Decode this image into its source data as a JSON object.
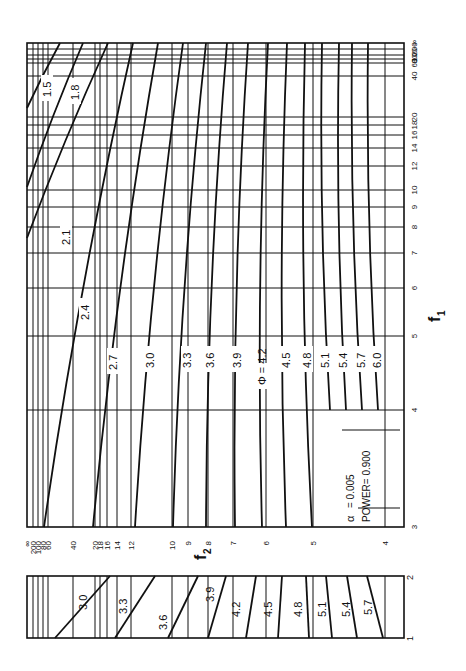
{
  "chart_data": {
    "type": "line",
    "orientation": "rotated 90 degrees clockwise",
    "annotation": {
      "alpha_label": "α",
      "alpha_value": "= 0.005",
      "power_label": "POWER= 0.900"
    },
    "main_plot": {
      "xlabel": "f2",
      "ylabel": "f1",
      "f2_ticks": [
        {
          "label": "∞",
          "x": 27
        },
        {
          "label": "200",
          "x": 33
        },
        {
          "label": "100",
          "x": 38
        },
        {
          "label": "80",
          "x": 43
        },
        {
          "label": "60",
          "x": 48
        },
        {
          "label": "40",
          "x": 73
        },
        {
          "label": "20",
          "x": 95
        },
        {
          "label": "18",
          "x": 100
        },
        {
          "label": "16",
          "x": 107
        },
        {
          "label": "14",
          "x": 117
        },
        {
          "label": "12",
          "x": 131
        },
        {
          "label": "10",
          "x": 172
        },
        {
          "label": "9",
          "x": 188
        },
        {
          "label": "8",
          "x": 208
        },
        {
          "label": "7",
          "x": 233
        },
        {
          "label": "6",
          "x": 266
        },
        {
          "label": "5",
          "x": 313
        },
        {
          "label": "4",
          "x": 385
        }
      ],
      "f1_ticks": [
        {
          "label": "∞",
          "y": 43
        },
        {
          "label": "200",
          "y": 49
        },
        {
          "label": "100",
          "y": 55
        },
        {
          "label": "80",
          "y": 59
        },
        {
          "label": "60",
          "y": 63
        },
        {
          "label": "40",
          "y": 76
        },
        {
          "label": "20",
          "y": 117
        },
        {
          "label": "18",
          "y": 125
        },
        {
          "label": "16",
          "y": 135
        },
        {
          "label": "14",
          "y": 148
        },
        {
          "label": "12",
          "y": 166
        },
        {
          "label": "10",
          "y": 190
        },
        {
          "label": "9",
          "y": 207
        },
        {
          "label": "8",
          "y": 227
        },
        {
          "label": "7",
          "y": 253
        },
        {
          "label": "6",
          "y": 288
        },
        {
          "label": "5",
          "y": 336
        },
        {
          "label": "4",
          "y": 410
        },
        {
          "label": "3",
          "y": 527
        }
      ],
      "series": [
        {
          "name": "1.5",
          "x0": 27,
          "y0": 108,
          "x1": 60,
          "y1": 43
        },
        {
          "name": "1.8",
          "x0": 27,
          "y0": 187,
          "x1": 83,
          "y1": 43
        },
        {
          "name": "2.1",
          "x0": 27,
          "y0": 238,
          "x1": 108,
          "y1": 43
        },
        {
          "name": "2.4",
          "x0": 44,
          "y0": 527,
          "x1": 133,
          "y1": 43
        },
        {
          "name": "2.7",
          "x0": 93,
          "y0": 527,
          "x1": 158,
          "y1": 43
        },
        {
          "name": "3.0",
          "x0": 135,
          "y0": 527,
          "x1": 183,
          "y1": 43
        },
        {
          "name": "3.3",
          "x0": 173,
          "y0": 527,
          "x1": 206,
          "y1": 43
        },
        {
          "name": "3.6",
          "x0": 206,
          "y0": 527,
          "x1": 227,
          "y1": 43
        },
        {
          "name": "3.9",
          "x0": 235,
          "y0": 527,
          "x1": 248,
          "y1": 43
        },
        {
          "name": "Φ=4.2",
          "x0": 262,
          "y0": 527,
          "x1": 268,
          "y1": 43
        },
        {
          "name": "4.5",
          "x0": 286,
          "y0": 527,
          "x1": 287,
          "y1": 43
        },
        {
          "name": "4.8",
          "x0": 312,
          "y0": 527,
          "x1": 305,
          "y1": 43
        },
        {
          "name": "5.1",
          "x0": 330,
          "y0": 410,
          "x1": 322,
          "y1": 43
        },
        {
          "name": "5.4",
          "x0": 346,
          "y0": 410,
          "x1": 339,
          "y1": 43
        },
        {
          "name": "5.7",
          "x0": 362,
          "y0": 410,
          "x1": 352,
          "y1": 43
        },
        {
          "name": "6.0",
          "x0": 378,
          "y0": 410,
          "x1": 368,
          "y1": 43
        }
      ],
      "curve_labels": [
        {
          "text": "1.5",
          "x": 47,
          "y": 97
        },
        {
          "text": "1.8",
          "x": 75,
          "y": 100
        },
        {
          "text": "2.1",
          "x": 66,
          "y": 245
        },
        {
          "text": "2.4",
          "x": 85,
          "y": 320
        },
        {
          "text": "2.7",
          "x": 113,
          "y": 370
        },
        {
          "text": "3.0",
          "x": 150,
          "y": 368
        },
        {
          "text": "3.3",
          "x": 187,
          "y": 368
        },
        {
          "text": "3.6",
          "x": 210,
          "y": 368
        },
        {
          "text": "3.9",
          "x": 237,
          "y": 368
        },
        {
          "text": "Φ = 4.2",
          "x": 262,
          "y": 385
        },
        {
          "text": "4.5",
          "x": 286,
          "y": 368
        },
        {
          "text": "4.8",
          "x": 307,
          "y": 368
        },
        {
          "text": "5.1",
          "x": 325,
          "y": 368
        },
        {
          "text": "5.4",
          "x": 343,
          "y": 368
        },
        {
          "text": "5.7",
          "x": 361,
          "y": 368
        },
        {
          "text": "6.0",
          "x": 377,
          "y": 368
        }
      ]
    },
    "inset_plot": {
      "ylabel": "f1",
      "f1_range": [
        "1",
        "2"
      ],
      "series": [
        {
          "name": "3.0",
          "x0": 55,
          "y0": 638,
          "x1": 110,
          "y1": 576
        },
        {
          "name": "3.3",
          "x0": 115,
          "y0": 638,
          "x1": 155,
          "y1": 576
        },
        {
          "name": "3.6",
          "x0": 168,
          "y0": 638,
          "x1": 198,
          "y1": 576
        },
        {
          "name": "3.9",
          "x0": 208,
          "y0": 638,
          "x1": 226,
          "y1": 576
        },
        {
          "name": "4.2",
          "x0": 246,
          "y0": 638,
          "x1": 256,
          "y1": 576
        },
        {
          "name": "4.5",
          "x0": 278,
          "y0": 638,
          "x1": 282,
          "y1": 576
        },
        {
          "name": "4.8",
          "x0": 309,
          "y0": 638,
          "x1": 306,
          "y1": 576
        },
        {
          "name": "5.1",
          "x0": 332,
          "y0": 638,
          "x1": 326,
          "y1": 576
        },
        {
          "name": "5.4",
          "x0": 357,
          "y0": 638,
          "x1": 347,
          "y1": 576
        },
        {
          "name": "5.7",
          "x0": 383,
          "y0": 638,
          "x1": 367,
          "y1": 576
        }
      ],
      "gridlines_x": [
        33,
        38,
        43,
        48,
        73,
        95,
        100,
        107,
        117,
        131,
        172,
        188,
        208,
        233,
        266,
        313,
        385
      ],
      "curve_labels": [
        {
          "text": "3.0",
          "x": 83,
          "y": 598
        },
        {
          "text": "3.3",
          "x": 123,
          "y": 602
        },
        {
          "text": "3.6",
          "x": 163,
          "y": 618
        },
        {
          "text": "3.9",
          "x": 210,
          "y": 590
        },
        {
          "text": "4.2",
          "x": 236,
          "y": 605
        },
        {
          "text": "4.5",
          "x": 268,
          "y": 605
        },
        {
          "text": "4.8",
          "x": 298,
          "y": 605
        },
        {
          "text": "5.1",
          "x": 322,
          "y": 605
        },
        {
          "text": "5.4",
          "x": 346,
          "y": 605
        },
        {
          "text": "5.7",
          "x": 368,
          "y": 603
        }
      ]
    }
  },
  "labels": {
    "f1_axis": "f",
    "f1_sub": "1",
    "f2_axis": "f",
    "f2_sub": "2",
    "inset_f1_low": "1",
    "inset_f1_high": "2"
  },
  "colors": {
    "ink": "#111111",
    "background": "#ffffff"
  }
}
